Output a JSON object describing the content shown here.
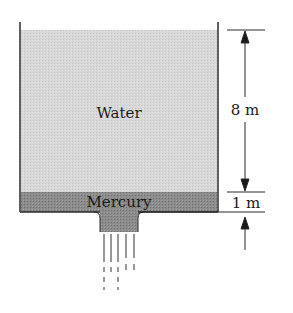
{
  "diagram": {
    "type": "tank-with-two-layered-fluids-draining",
    "labels": {
      "upper_fluid": "Water",
      "lower_fluid": "Mercury"
    },
    "dimensions": {
      "water_height": "8 m",
      "mercury_height": "1 m"
    },
    "colors": {
      "water": "#d6d6d6",
      "mercury": "#8a8a8a",
      "walls": "#2a2a2a",
      "background": "#ffffff"
    }
  }
}
